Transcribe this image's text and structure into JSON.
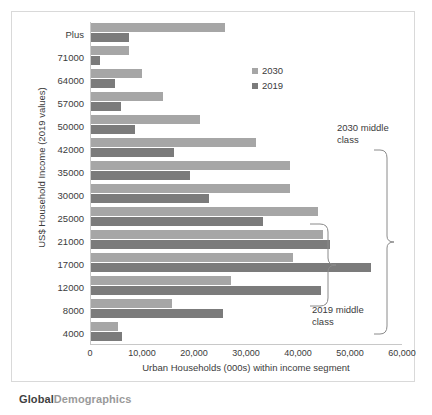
{
  "chart_data": {
    "type": "bar",
    "orientation": "horizontal",
    "title": "",
    "xlabel": "Urban Households (000s) within income segment",
    "ylabel": "US$ Household Income (2019 values)",
    "categories": [
      "Plus",
      "71000",
      "64000",
      "57000",
      "50000",
      "42000",
      "35000",
      "30000",
      "25000",
      "21000",
      "17000",
      "12000",
      "8000",
      "4000"
    ],
    "series": [
      {
        "name": "2030",
        "color": "#a6a6a6",
        "values": [
          25800,
          7300,
          9800,
          13800,
          20900,
          31800,
          38200,
          38200,
          43600,
          44700,
          38900,
          26900,
          15600,
          5100
        ]
      },
      {
        "name": "2019",
        "color": "#7b7b7b",
        "values": [
          7300,
          1800,
          4700,
          5800,
          8400,
          16000,
          19100,
          22700,
          33100,
          46000,
          53800,
          44200,
          25300,
          6000
        ]
      }
    ],
    "xlim": [
      0,
      60000
    ],
    "xticks": [
      0,
      10000,
      20000,
      30000,
      40000,
      50000,
      60000
    ],
    "xtick_labels": [
      "0",
      "10,000",
      "20,000",
      "30,000",
      "40,000",
      "50,000",
      "60,000"
    ],
    "grid": false,
    "legend_position": "upper right",
    "annotations": [
      {
        "id": "annot-2030",
        "text": "2030 middle class",
        "brace_from": "42000",
        "brace_to": "21000"
      },
      {
        "id": "annot-2019",
        "text": "2019 middle class",
        "brace_from": "25000",
        "brace_to": "12000"
      }
    ]
  },
  "legend": {
    "items": [
      {
        "label": "2030",
        "color": "#a6a6a6"
      },
      {
        "label": "2019",
        "color": "#7b7b7b"
      }
    ]
  },
  "annotations": {
    "middle_class_2030": "2030 middle\nclass",
    "middle_class_2030_line1": "2030 middle",
    "middle_class_2030_line2": "class",
    "middle_class_2019_line1": "2019 middle",
    "middle_class_2019_line2": "class"
  },
  "watermark": {
    "part_bold": "Global",
    "part_light": "Demographics"
  }
}
